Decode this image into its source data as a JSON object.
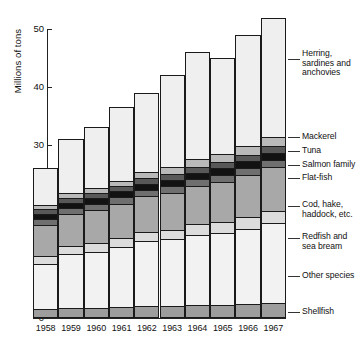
{
  "chart_data": {
    "type": "bar",
    "title": "",
    "subtitle": "",
    "xlabel": "",
    "ylabel": "Millions of tons",
    "ylim": [
      0,
      52
    ],
    "yticks": [
      0,
      10,
      20,
      30,
      40,
      50
    ],
    "ytick_labels": [
      "0",
      "10",
      "20",
      "30",
      "40",
      "50"
    ],
    "grid": false,
    "stacked": true,
    "legend_position": "right",
    "categories": [
      "1958",
      "1959",
      "1960",
      "1961",
      "1962",
      "1963",
      "1964",
      "1965",
      "1966",
      "1967"
    ],
    "series": [
      {
        "name": "Shellfish",
        "color": "#9d9d9d",
        "values": [
          1.6,
          1.7,
          1.8,
          1.9,
          2.0,
          2.1,
          2.2,
          2.3,
          2.4,
          2.6
        ]
      },
      {
        "name": "Other species",
        "color": "#f2f2f2",
        "values": [
          7.8,
          9.3,
          9.6,
          10.4,
          11.3,
          11.5,
          12.2,
          12.4,
          13.0,
          13.8
        ]
      },
      {
        "name": "Redfish and sea bream",
        "color": "#dcdcdc",
        "values": [
          1.3,
          1.4,
          1.5,
          1.5,
          1.6,
          1.7,
          1.8,
          1.9,
          2.0,
          2.1
        ]
      },
      {
        "name": "Cod, hake, haddock, etc.",
        "color": "#a8a8a8",
        "values": [
          5.4,
          5.6,
          5.8,
          6.0,
          6.2,
          6.4,
          6.6,
          7.0,
          7.3,
          7.6
        ]
      },
      {
        "name": "Flat-fish",
        "color": "#6f6f6f",
        "values": [
          1.0,
          1.0,
          1.0,
          1.1,
          1.1,
          1.1,
          1.2,
          1.2,
          1.2,
          1.3
        ]
      },
      {
        "name": "Salmon family",
        "color": "#121212",
        "values": [
          0.9,
          0.9,
          1.0,
          1.0,
          1.0,
          1.1,
          1.1,
          1.1,
          1.2,
          1.2
        ]
      },
      {
        "name": "Tuna",
        "color": "#585858",
        "values": [
          0.8,
          0.8,
          0.9,
          0.9,
          1.0,
          1.0,
          1.1,
          1.1,
          1.2,
          1.2
        ]
      },
      {
        "name": "Mackerel",
        "color": "#b9b9b9",
        "values": [
          0.8,
          0.9,
          0.9,
          1.0,
          1.1,
          1.2,
          1.3,
          1.4,
          1.5,
          1.6
        ]
      },
      {
        "name": "Herring, sardines and anchovies",
        "color": "#efefef",
        "values": [
          6.4,
          9.4,
          10.5,
          12.8,
          13.7,
          15.9,
          18.5,
          16.6,
          19.2,
          20.6
        ]
      }
    ],
    "totals": [
      26.0,
      31.0,
      33.0,
      36.6,
      39.0,
      42.0,
      46.0,
      45.0,
      49.0,
      52.0
    ]
  },
  "axes": {
    "y_title": "Millions of tons",
    "y_ticks": [
      {
        "label": "50",
        "value": 50
      },
      {
        "label": "40",
        "value": 40
      },
      {
        "label": "30",
        "value": 30
      },
      {
        "label": "20",
        "value": 20
      },
      {
        "label": "10",
        "value": 10
      },
      {
        "label": "0",
        "value": 0
      }
    ],
    "x_ticks": [
      "1958",
      "1959",
      "1960",
      "1961",
      "1962",
      "1963",
      "1964",
      "1965",
      "1966",
      "1967"
    ]
  },
  "legend": {
    "items": [
      {
        "label": "Herring,\nsardines and\nanchovies",
        "key": "herring"
      },
      {
        "label": "Mackerel",
        "key": "mackerel"
      },
      {
        "label": "Tuna",
        "key": "tuna"
      },
      {
        "label": "Salmon family",
        "key": "salmon"
      },
      {
        "label": "Flat-fish",
        "key": "flat"
      },
      {
        "label": "Cod, hake,\nhaddock, etc.",
        "key": "cod"
      },
      {
        "label": "Redfish and\nsea bream",
        "key": "redfish"
      },
      {
        "label": "Other species",
        "key": "other"
      },
      {
        "label": "Shellfish",
        "key": "shellfish"
      }
    ]
  }
}
